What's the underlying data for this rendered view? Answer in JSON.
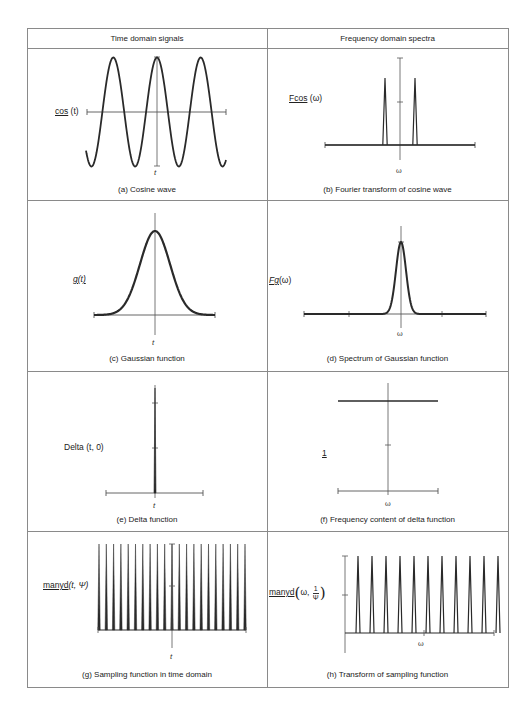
{
  "table": {
    "headers": [
      "Time domain signals",
      "Frequency domain spectra"
    ],
    "frame": {
      "left": 27,
      "top": 28,
      "right": 508,
      "bottom": 687
    },
    "divider_x": 267,
    "header_bottom": 48,
    "row_lines": [
      200,
      371,
      531
    ],
    "line_color": "#8a8a8a",
    "ink_color": "#2a2a2a"
  },
  "panels": {
    "a": {
      "caption": "(a) Cosine wave",
      "ylabel_main": "cos",
      "ylabel_arg": "(t)",
      "xlabel": "t"
    },
    "b": {
      "caption": "(b) Fourier transform of cosine wave",
      "ylabel_main": "Fcos",
      "ylabel_arg": "(ω)",
      "xlabel": "ω"
    },
    "c": {
      "caption": "(c) Gaussian function",
      "ylabel_main": "g(t)",
      "xlabel": "t"
    },
    "d": {
      "caption": "(d) Spectrum of Gaussian function",
      "ylabel_main": "Fg",
      "ylabel_arg": "(ω)",
      "xlabel": "ω"
    },
    "e": {
      "caption": "(e) Delta function",
      "ylabel_main": "Delta",
      "ylabel_arg": "(t, 0)",
      "xlabel": "t"
    },
    "f": {
      "caption": "(f) Frequency content of delta function",
      "ylabel_main": "1",
      "xlabel": "ω"
    },
    "g": {
      "caption": "(g) Sampling function in time domain",
      "ylabel_main": "manyd",
      "ylabel_arg": "(t, Ψ)",
      "xlabel": "t"
    },
    "h": {
      "caption": "(h) Transform of sampling function",
      "ylabel_main": "manyd",
      "ylabel_arg_pre": "ω,",
      "frac_num": "1",
      "frac_den": "Ψ",
      "xlabel": "ω"
    }
  },
  "chart_data": [
    {
      "id": "a",
      "type": "line",
      "title": "(a) Cosine wave",
      "function": "cos(t)",
      "xlabel": "t",
      "ylabel": "cos (t)",
      "cycles_shown": 3.2,
      "geometry": {
        "x0": 86,
        "x1": 226,
        "axis_y": 112,
        "amp": 54.5,
        "period": 43.7,
        "peak_x": 157,
        "axis_x": 157,
        "vaxis_top": 57,
        "vaxis_bottom": 166,
        "haxis_left": 87,
        "haxis_right": 226
      }
    },
    {
      "id": "b",
      "type": "line",
      "title": "(b) Fourier transform of cosine wave",
      "function": "F cos(ω)",
      "xlabel": "ω",
      "ylabel": "Fcos (ω)",
      "peaks_at": [
        -1,
        1
      ],
      "geometry": {
        "axis_x": 400,
        "vaxis_top": 58,
        "vaxis_bottom": 160,
        "base_y": 145,
        "haxis_left": 325,
        "haxis_right": 475,
        "peaks_x": [
          385,
          415
        ],
        "peak_top": 78,
        "peak_halfwidth": 2.2,
        "mid_tick_y": 102
      }
    },
    {
      "id": "c",
      "type": "line",
      "title": "(c) Gaussian function",
      "function": "g(t)",
      "xlabel": "t",
      "ylabel": "g(t)",
      "geometry": {
        "axis_x": 155,
        "vaxis_top": 213,
        "vaxis_bottom": 335,
        "base_y": 315,
        "haxis_left": 94,
        "haxis_right": 215,
        "peak_y": 231,
        "sigma": 15
      }
    },
    {
      "id": "d",
      "type": "line",
      "title": "(d) Spectrum of Gaussian function",
      "function": "Fg(ω)",
      "xlabel": "ω",
      "ylabel": "Fg(ω)",
      "geometry": {
        "axis_x": 401,
        "vaxis_top": 226,
        "vaxis_bottom": 328,
        "base_y": 314,
        "haxis_left": 304,
        "haxis_right": 486,
        "ticks_x": [
          349,
          442
        ],
        "peak_y": 242,
        "sigma": 5
      }
    },
    {
      "id": "e",
      "type": "line",
      "title": "(e) Delta function",
      "function": "Delta(t, 0)",
      "xlabel": "t",
      "ylabel": "Delta (t, 0)",
      "geometry": {
        "axis_x": 155,
        "vaxis_top": 385,
        "vaxis_bottom": 498,
        "base_y": 493,
        "haxis_left": 106,
        "haxis_right": 203,
        "ticks_y": [
          403,
          448
        ]
      }
    },
    {
      "id": "f",
      "type": "line",
      "title": "(f) Frequency content of delta function",
      "function": "1",
      "xlabel": "ω",
      "ylabel": "1",
      "geometry": {
        "axis_x": 388,
        "vaxis_top": 383,
        "vaxis_bottom": 495,
        "base_y": 491,
        "haxis_left": 338,
        "haxis_right": 438,
        "level_y": 401,
        "level_left": 338,
        "level_right": 438,
        "mid_tick_y": 445
      }
    },
    {
      "id": "g",
      "type": "line",
      "title": "(g) Sampling function in time domain",
      "function": "manyd(t, Ψ)",
      "xlabel": "t",
      "ylabel": "manyd(t, Ψ)",
      "spike_count": 21,
      "geometry": {
        "axis_x": 172,
        "vaxis_top": 544,
        "vaxis_bottom": 648,
        "base_y": 630,
        "haxis_left": 98,
        "haxis_right": 246,
        "spike_first_x": 99,
        "spike_spacing": 7.3,
        "spike_top": 544,
        "spike_halfwidth": 1.2,
        "mid_tick_y": 586
      }
    },
    {
      "id": "h",
      "type": "line",
      "title": "(h) Transform of sampling function",
      "function": "manyd(ω, 1/Ψ)",
      "xlabel": "ω",
      "ylabel": "manyd(ω, 1/Ψ)",
      "spike_count": 11,
      "geometry": {
        "axis_x": 345,
        "vaxis_top": 556,
        "vaxis_bottom": 653,
        "base_y": 633,
        "haxis_left": 345,
        "haxis_right": 494,
        "spike_first_x": 358,
        "spike_spacing": 14,
        "spike_top": 556,
        "spike_halfwidth": 2.0,
        "mid_tick_y": 595,
        "omega_tick_x": 424
      }
    }
  ]
}
